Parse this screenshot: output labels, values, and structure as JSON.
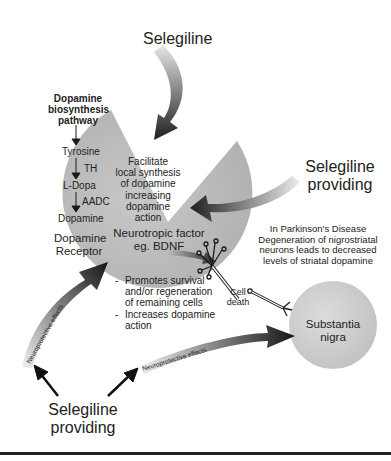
{
  "diagram": {
    "title_top": "Selegiline",
    "regions": {
      "striatum_shape": {
        "label": "Dopamine Receptor",
        "fill": "#bdbdbd"
      },
      "substantia_nigra": {
        "label_line1": "Substantia",
        "label_line2": "nigra",
        "fill": "#cfcfcf"
      }
    },
    "pathway": {
      "heading_line1": "Dopamine",
      "heading_line2": "biosynthesis",
      "heading_line3": "pathway",
      "steps": [
        "Tyrosine",
        "L-Dopa",
        "Dopamine"
      ],
      "enzymes": [
        "TH",
        "AADC"
      ]
    },
    "receptor_label_line1": "Dopamine",
    "receptor_label_line2": "Receptor",
    "facilitate_text": [
      "Facilitate",
      "local synthesis",
      "of dopamine",
      "increasing",
      "dopamine",
      "action"
    ],
    "neurotropic": {
      "line1": "Neurotropic factor",
      "line2": "eg. BDNF"
    },
    "effects": [
      {
        "bullet": "-",
        "lines": [
          "Promotes survival",
          "and/or regeneration",
          "of remaining cells"
        ]
      },
      {
        "bullet": "-",
        "lines": [
          "Increases dopamine",
          "action"
        ]
      }
    ],
    "selegiline_right": {
      "line1": "Selegiline",
      "line2": "providing"
    },
    "selegiline_bottom": {
      "line1": "Selegiline",
      "line2": "providing"
    },
    "parkinsons_note": [
      "In Parkinson's Disease",
      "Degeneration of nigrostriatal",
      "neurons leads to decreased",
      "levels of striatal dopamine"
    ],
    "cell_death": {
      "line1": "Cell",
      "line2": "death"
    },
    "arrow_labels": {
      "left_arrow": "Neuroprotective effects",
      "bottom_arrow": "Neuroprotective effects"
    },
    "colors": {
      "arrow_dark": "#1a1a1a",
      "arrow_light": "#e0e0e0",
      "shape_grey": "#bdbdbd",
      "text": "#222222"
    }
  }
}
